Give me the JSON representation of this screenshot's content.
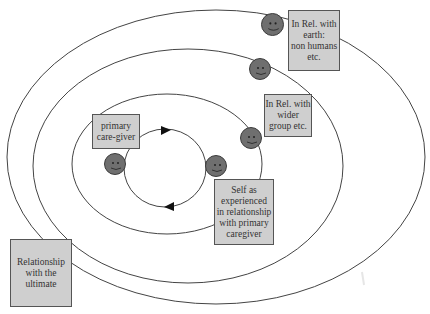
{
  "diagram": {
    "type": "concentric-relationship-rings",
    "colors": {
      "ring_stroke": "#444444",
      "box_fill": "#cfcfcf",
      "box_border": "#555555",
      "face_fill": "#6f6f6f",
      "text": "#333333"
    },
    "rings": [
      {
        "id": "outer",
        "cx": 216,
        "cy": 157,
        "rx": 209,
        "ry": 147
      },
      {
        "id": "second",
        "cx": 188,
        "cy": 166,
        "rx": 155,
        "ry": 117
      },
      {
        "id": "third",
        "cx": 167,
        "cy": 164,
        "rx": 95,
        "ry": 70
      },
      {
        "id": "inner-cycle",
        "cx": 165,
        "cy": 168,
        "rx": 41,
        "ry": 39
      }
    ],
    "labels": {
      "earth": {
        "lines": [
          "In Rel. with",
          "earth:",
          "non humans",
          "etc."
        ]
      },
      "wider_group": {
        "lines": [
          "In Rel. with",
          "wider",
          "group etc."
        ]
      },
      "primary_caregiver": {
        "lines": [
          "primary",
          "care-giver"
        ]
      },
      "self": {
        "lines": [
          "Self as",
          "experienced",
          "in relationship",
          "with primary",
          "caregiver"
        ]
      },
      "ultimate": {
        "lines": [
          "Relationship",
          "with the",
          "ultimate"
        ]
      }
    },
    "faces": [
      {
        "id": "earth-face",
        "x": 261,
        "y": 13
      },
      {
        "id": "second-ring-face",
        "x": 249,
        "y": 58
      },
      {
        "id": "wider-group-face",
        "x": 241,
        "y": 127
      },
      {
        "id": "self-face",
        "x": 205,
        "y": 155
      },
      {
        "id": "caregiver-face",
        "x": 104,
        "y": 153
      }
    ],
    "arrows": [
      {
        "id": "top-arrow",
        "direction": "right",
        "x": 166,
        "y": 131
      },
      {
        "id": "bottom-arrow",
        "direction": "left",
        "x": 169,
        "y": 207
      }
    ]
  }
}
